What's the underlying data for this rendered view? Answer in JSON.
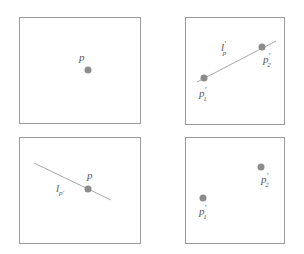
{
  "colors": {
    "frame": "#9a9a9a",
    "point": "#8c8c8c",
    "line": "#a8a8a8",
    "text": "#555555"
  },
  "panels": [
    {
      "id": "top-left",
      "frame": [
        19,
        17,
        121,
        106
      ],
      "points": [
        {
          "x": 88,
          "y": 70,
          "label": "p",
          "sub": "",
          "prime": "",
          "lx": 79,
          "ly": 61
        }
      ],
      "lines": []
    },
    {
      "id": "top-right",
      "frame": [
        185,
        17,
        136,
        107
      ],
      "points": [
        {
          "x": 204,
          "y": 78,
          "label": "p",
          "sub": "1",
          "prime": "′",
          "lx": 199,
          "ly": 97
        },
        {
          "x": 262,
          "y": 47,
          "label": "p",
          "sub": "2",
          "prime": "′",
          "lx": 263,
          "ly": 63
        }
      ],
      "lines": [
        {
          "x1": 197,
          "y1": 82,
          "x2": 276,
          "y2": 41,
          "label": "l",
          "sub": "p",
          "prime": "′",
          "lx": 221,
          "ly": 51
        }
      ]
    },
    {
      "id": "bottom-left",
      "frame": [
        19,
        137,
        121,
        106
      ],
      "points": [
        {
          "x": 88,
          "y": 189,
          "label": "p",
          "sub": "",
          "prime": "",
          "lx": 87,
          "ly": 179
        }
      ],
      "lines": [
        {
          "x1": 34,
          "y1": 163,
          "x2": 111,
          "y2": 200,
          "label": "l",
          "sub": "p′",
          "prime": "",
          "lx": 56,
          "ly": 192
        }
      ]
    },
    {
      "id": "bottom-right",
      "frame": [
        185,
        137,
        136,
        106
      ],
      "points": [
        {
          "x": 203,
          "y": 198,
          "label": "p",
          "sub": "1",
          "prime": "′",
          "lx": 199,
          "ly": 215
        },
        {
          "x": 261,
          "y": 167,
          "label": "p",
          "sub": "2",
          "prime": "′",
          "lx": 261,
          "ly": 183
        }
      ],
      "lines": []
    }
  ]
}
